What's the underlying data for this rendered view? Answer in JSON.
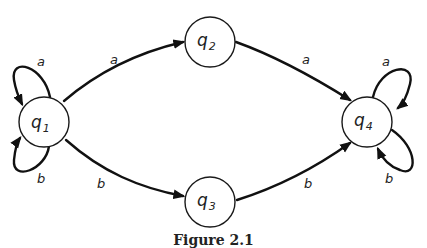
{
  "figure": {
    "caption": "Figure 2.1",
    "states": [
      {
        "id": "q1",
        "base": "q",
        "sub": "1",
        "cx": 44,
        "cy": 122,
        "r": 25
      },
      {
        "id": "q2",
        "base": "q",
        "sub": "2",
        "cx": 210,
        "cy": 42,
        "r": 25
      },
      {
        "id": "q3",
        "base": "q",
        "sub": "3",
        "cx": 210,
        "cy": 202,
        "r": 25
      },
      {
        "id": "q4",
        "base": "q",
        "sub": "4",
        "cx": 367,
        "cy": 122,
        "r": 25
      }
    ],
    "transitions": [
      {
        "from": "q1",
        "to": "q1",
        "symbol": "a"
      },
      {
        "from": "q1",
        "to": "q1",
        "symbol": "b"
      },
      {
        "from": "q1",
        "to": "q2",
        "symbol": "a"
      },
      {
        "from": "q1",
        "to": "q3",
        "symbol": "b"
      },
      {
        "from": "q2",
        "to": "q4",
        "symbol": "a"
      },
      {
        "from": "q3",
        "to": "q4",
        "symbol": "b"
      },
      {
        "from": "q4",
        "to": "q4",
        "symbol": "a"
      },
      {
        "from": "q4",
        "to": "q4",
        "symbol": "b"
      }
    ],
    "labels": {
      "q1_self_a": "a",
      "q1_self_b": "b",
      "q1_q2": "a",
      "q1_q3": "b",
      "q2_q4": "a",
      "q3_q4": "b",
      "q4_self_a": "a",
      "q4_self_b": "b"
    },
    "state_labels": {
      "q1": {
        "base": "q",
        "sub": "1"
      },
      "q2": {
        "base": "q",
        "sub": "2"
      },
      "q3": {
        "base": "q",
        "sub": "3"
      },
      "q4": {
        "base": "q",
        "sub": "4"
      }
    }
  }
}
